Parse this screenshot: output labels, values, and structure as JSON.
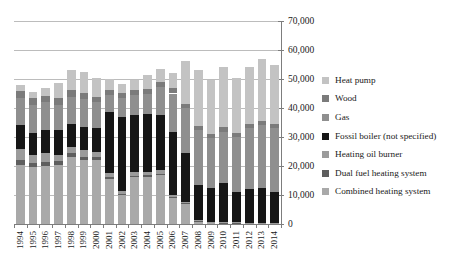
{
  "chart_data": {
    "type": "bar",
    "stacked": true,
    "title": "",
    "xlabel": "",
    "ylabel": "",
    "categories": [
      "1994",
      "1995",
      "1996",
      "1997",
      "1998",
      "1999",
      "2000",
      "2001",
      "2002",
      "2003",
      "2004",
      "2005",
      "2006",
      "2007",
      "2008",
      "2009",
      "2010",
      "2011",
      "2012",
      "2013",
      "2014"
    ],
    "y_axis": {
      "min": 0,
      "max": 70000,
      "step": 10000,
      "side": "right",
      "tick_labels": [
        "0",
        "10,000",
        "20,000",
        "30,000",
        "40,000",
        "50,000",
        "60,000",
        "70,000"
      ]
    },
    "grid": true,
    "legend_position": "right",
    "legend_order_top_to_bottom": [
      "Heat pump",
      "Wood",
      "Gas",
      "Fossil boiler (not specified)",
      "Heating oil burner",
      "Dual fuel heating system",
      "Combined heating system"
    ],
    "series": [
      {
        "name": "Combined heating system",
        "color": "#a9a9a9",
        "values": [
          20500,
          19500,
          20000,
          20300,
          23200,
          21900,
          22000,
          15500,
          10000,
          16200,
          16300,
          16900,
          9000,
          7000,
          900,
          400,
          300,
          300,
          300,
          300,
          300
        ]
      },
      {
        "name": "Dual fuel heating system",
        "color": "#5e5e5e",
        "values": [
          1500,
          1400,
          1400,
          1300,
          1200,
          1100,
          1000,
          700,
          500,
          500,
          500,
          500,
          400,
          300,
          200,
          200,
          150,
          150,
          100,
          100,
          100
        ]
      },
      {
        "name": "Heating oil burner",
        "color": "#9b9b9b",
        "values": [
          3800,
          2800,
          3100,
          2200,
          2200,
          2500,
          1900,
          1300,
          1000,
          1300,
          1200,
          1200,
          600,
          400,
          300,
          200,
          150,
          150,
          100,
          100,
          100
        ]
      },
      {
        "name": "Fossil boiler (not specified)",
        "color": "#161616",
        "values": [
          8200,
          7800,
          8000,
          8600,
          8000,
          8000,
          8100,
          21200,
          25500,
          19600,
          19800,
          19000,
          21800,
          16700,
          12000,
          11500,
          13400,
          10500,
          11500,
          12000,
          10500
        ]
      },
      {
        "name": "Gas",
        "color": "#8f8f8f",
        "values": [
          9500,
          9500,
          9500,
          8700,
          9300,
          9500,
          8900,
          5800,
          6300,
          6900,
          6900,
          9700,
          13200,
          15500,
          19000,
          17200,
          17800,
          18900,
          21000,
          21500,
          22000
        ]
      },
      {
        "name": "Wood",
        "color": "#7b7b7b",
        "values": [
          2500,
          2500,
          2200,
          2200,
          2200,
          2100,
          2000,
          1800,
          1800,
          1700,
          1900,
          1800,
          1800,
          1600,
          1500,
          1500,
          1500,
          1500,
          1500,
          1500,
          1500
        ]
      },
      {
        "name": "Heat pump",
        "color": "#c3c3c3",
        "values": [
          2000,
          2000,
          2800,
          5200,
          6900,
          7400,
          6300,
          3700,
          3100,
          3500,
          4800,
          4300,
          5200,
          14700,
          19200,
          18500,
          20700,
          19000,
          19500,
          21500,
          20500
        ]
      }
    ],
    "totals": [
      48000,
      45500,
      47000,
      48500,
      53000,
      52500,
      50200,
      50000,
      48200,
      49700,
      51400,
      53400,
      52000,
      56200,
      53100,
      49500,
      54000,
      50500,
      54000,
      57000,
      55000
    ]
  }
}
